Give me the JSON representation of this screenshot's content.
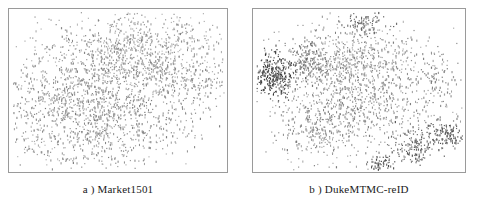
{
  "figure": {
    "background_color": "#ffffff",
    "frame_color": "#9a9a9a",
    "point_color": "#6e6e6e",
    "point_color_dark": "#3a3a3a"
  },
  "panels": [
    {
      "id": "panel-a",
      "caption": "a ) Market1501",
      "dataset": "Market1501",
      "label": "a )"
    },
    {
      "id": "panel-b",
      "caption": "b ) DukeMTMC-reID",
      "dataset": "DukeMTMC-reID",
      "label": "b )"
    }
  ],
  "chart_data": [
    {
      "type": "scatter",
      "title": "a ) Market1501",
      "xlabel": "",
      "ylabel": "",
      "xlim": [
        0,
        1
      ],
      "ylim": [
        0,
        1
      ],
      "grid": false,
      "legend": "none",
      "axis_ticks": false,
      "marker_size": 1.3,
      "marker_color": "#6e6e6e",
      "n_points": 2400,
      "description": "t-SNE embedding of Market1501 features: one large diffuse cloud occupying most of the frame, densest in the upper-centre and centre, with a diagonal band of points extending toward the right edge and sparse outliers at the left and lower-left.",
      "clusters": [
        {
          "name": "upper-centre-dense",
          "cx": 0.55,
          "cy": 0.26,
          "sx": 0.17,
          "sy": 0.13,
          "weight": 620,
          "shade": 0.62
        },
        {
          "name": "central-core",
          "cx": 0.45,
          "cy": 0.52,
          "sx": 0.2,
          "sy": 0.17,
          "weight": 760,
          "shade": 0.58
        },
        {
          "name": "lower-centre",
          "cx": 0.44,
          "cy": 0.78,
          "sx": 0.19,
          "sy": 0.12,
          "weight": 430,
          "shade": 0.6
        },
        {
          "name": "left-flank",
          "cx": 0.17,
          "cy": 0.58,
          "sx": 0.1,
          "sy": 0.17,
          "weight": 280,
          "shade": 0.62
        },
        {
          "name": "right-diagonal-band",
          "cx": 0.83,
          "cy": 0.45,
          "sx": 0.12,
          "sy": 0.1,
          "weight": 230,
          "shade": 0.6
        },
        {
          "name": "top-right-sparse",
          "cx": 0.78,
          "cy": 0.18,
          "sx": 0.11,
          "sy": 0.08,
          "weight": 110,
          "shade": 0.66
        }
      ]
    },
    {
      "type": "scatter",
      "title": "b ) DukeMTMC-reID",
      "xlabel": "",
      "ylabel": "",
      "xlim": [
        0,
        1
      ],
      "ylim": [
        0,
        1
      ],
      "grid": false,
      "legend": "none",
      "axis_ticks": false,
      "marker_size": 1.3,
      "marker_color": "#6e6e6e",
      "n_points": 2300,
      "description": "t-SNE embedding of DukeMTMC-reID features: a large central cloud plus several well separated satellite clusters — a compact dark cluster on the left edge, a small cluster at top centre, and small dense groups near the right and bottom-right edges.",
      "clusters": [
        {
          "name": "central-core",
          "cx": 0.5,
          "cy": 0.55,
          "sx": 0.19,
          "sy": 0.18,
          "weight": 900,
          "shade": 0.58
        },
        {
          "name": "upper-centre",
          "cx": 0.47,
          "cy": 0.28,
          "sx": 0.17,
          "sy": 0.11,
          "weight": 420,
          "shade": 0.6
        },
        {
          "name": "left-dark-satellite",
          "cx": 0.09,
          "cy": 0.4,
          "sx": 0.05,
          "sy": 0.07,
          "weight": 300,
          "shade": 0.3
        },
        {
          "name": "top-centre-satellite",
          "cx": 0.53,
          "cy": 0.07,
          "sx": 0.05,
          "sy": 0.04,
          "weight": 90,
          "shade": 0.42
        },
        {
          "name": "left-mid-band",
          "cx": 0.25,
          "cy": 0.32,
          "sx": 0.06,
          "sy": 0.08,
          "weight": 150,
          "shade": 0.48
        },
        {
          "name": "lower-left-tail",
          "cx": 0.28,
          "cy": 0.72,
          "sx": 0.08,
          "sy": 0.12,
          "weight": 200,
          "shade": 0.58
        },
        {
          "name": "right-edge-cluster",
          "cx": 0.92,
          "cy": 0.78,
          "sx": 0.05,
          "sy": 0.04,
          "weight": 130,
          "shade": 0.38
        },
        {
          "name": "bottom-right-cluster",
          "cx": 0.76,
          "cy": 0.86,
          "sx": 0.05,
          "sy": 0.06,
          "weight": 140,
          "shade": 0.4
        },
        {
          "name": "bottom-centre-satellite",
          "cx": 0.6,
          "cy": 0.96,
          "sx": 0.03,
          "sy": 0.03,
          "weight": 60,
          "shade": 0.36
        },
        {
          "name": "right-mid-sparse",
          "cx": 0.88,
          "cy": 0.42,
          "sx": 0.05,
          "sy": 0.1,
          "weight": 70,
          "shade": 0.55
        }
      ]
    }
  ]
}
